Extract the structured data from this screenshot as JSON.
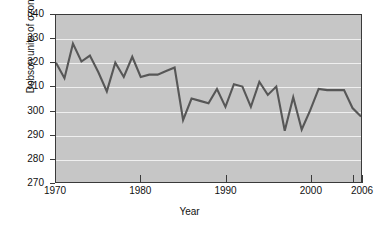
{
  "chart_data": {
    "type": "line",
    "title": "",
    "xlabel": "Year",
    "ylabel": "Dobson units of ozone",
    "xlim": [
      1970,
      2006
    ],
    "ylim": [
      270,
      340
    ],
    "grid": true,
    "legend": false,
    "series_color": "#575757",
    "plot_background": "#c6c6c6",
    "gridline_color": "#efefef",
    "y_ticks": [
      270,
      280,
      290,
      300,
      310,
      320,
      330,
      340
    ],
    "y_tick_labels": [
      "270",
      "280",
      "290",
      "300",
      "310",
      "320",
      "330",
      "340"
    ],
    "x_ticks": [
      1970,
      1980,
      1990,
      2000,
      2005,
      2006
    ],
    "x_tick_labels": [
      "1970",
      "1980",
      "1990",
      "2000",
      "",
      "2006"
    ],
    "x": [
      1970,
      1971,
      1972,
      1973,
      1974,
      1975,
      1976,
      1977,
      1978,
      1979,
      1980,
      1981,
      1982,
      1983,
      1984,
      1985,
      1986,
      1987,
      1988,
      1989,
      1990,
      1991,
      1992,
      1993,
      1994,
      1995,
      1996,
      1997,
      1998,
      1999,
      2000,
      2001,
      2002,
      2003,
      2004,
      2005,
      2006
    ],
    "values": [
      320,
      313.5,
      328,
      320.5,
      323,
      316,
      308,
      320,
      314,
      322.5,
      314,
      315,
      315,
      316.5,
      318,
      296,
      305,
      304,
      303,
      309,
      301.5,
      311,
      310,
      301.5,
      312,
      306.5,
      310,
      291.5,
      305.5,
      292,
      300,
      309,
      308.5,
      308.5,
      308.5,
      301,
      297.5
    ],
    "series": [
      {
        "name": "Dobson units of ozone",
        "values": [
          320,
          313.5,
          328,
          320.5,
          323,
          316,
          308,
          320,
          314,
          322.5,
          314,
          315,
          315,
          316.5,
          318,
          296,
          305,
          304,
          303,
          309,
          301.5,
          311,
          310,
          301.5,
          312,
          306.5,
          310,
          291.5,
          305.5,
          292,
          300,
          309,
          308.5,
          308.5,
          308.5,
          301,
          297.5
        ]
      }
    ]
  }
}
